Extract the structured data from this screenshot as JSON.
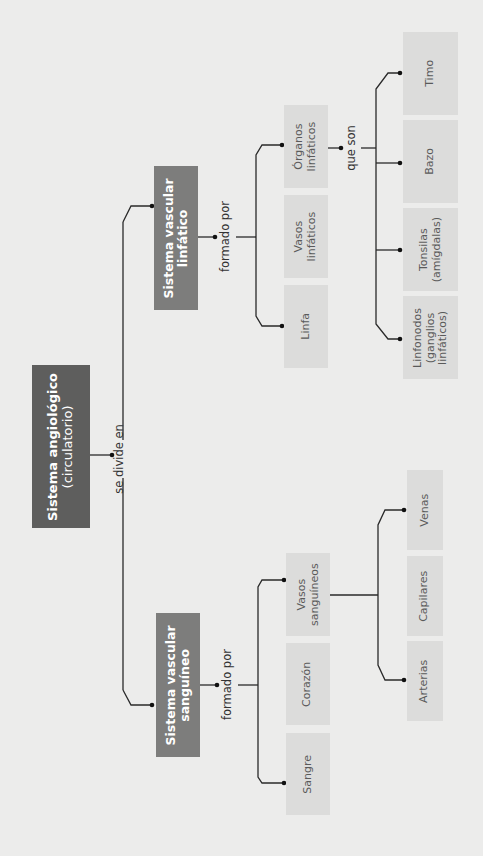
{
  "root": {
    "title": "Sistema angiológico",
    "subtitle": "(circulatorio)"
  },
  "root_connector": "se divide en",
  "branches": {
    "sanguineo": {
      "title_line1": "Sistema vascular",
      "title_line2": "sanguíneo",
      "connector": "formado por",
      "items": [
        {
          "line1": "Vasos",
          "line2": "sanguíneos"
        },
        {
          "line1": "Corazón",
          "line2": ""
        },
        {
          "line1": "Sangre",
          "line2": ""
        }
      ],
      "vasos_children": [
        {
          "label": "Venas"
        },
        {
          "label": "Capilares"
        },
        {
          "label": "Arterias"
        }
      ]
    },
    "linfatico": {
      "title_line1": "Sistema vascular",
      "title_line2": "linfático",
      "connector": "formado por",
      "items": [
        {
          "line1": "Órganos",
          "line2": "linfáticos"
        },
        {
          "line1": "Vasos",
          "line2": "linfáticos"
        },
        {
          "line1": "Linfa",
          "line2": ""
        }
      ],
      "organos_connector": "que son",
      "organos_children": [
        {
          "line1": "Timo",
          "line2": "",
          "line3": ""
        },
        {
          "line1": "Bazo",
          "line2": "",
          "line3": ""
        },
        {
          "line1": "Tonsilas",
          "line2": "(amígdalas)",
          "line3": ""
        },
        {
          "line1": "Linfonodos",
          "line2": "(ganglios",
          "line3": "linfáticos)"
        }
      ]
    }
  },
  "colors": {
    "background": "#ececeb",
    "root_box": "#5e5e5d",
    "level1_box": "#7d7d7c",
    "leaf_box": "#dcdcdb",
    "line": "#2a2a2a"
  }
}
